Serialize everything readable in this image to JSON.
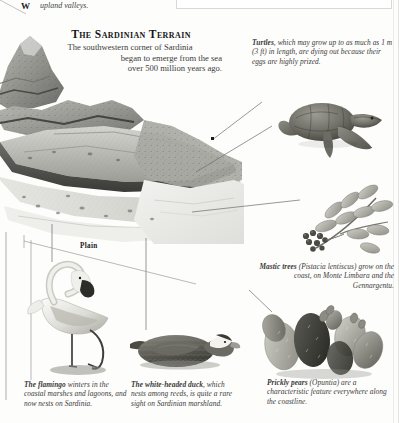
{
  "document": {
    "fragment_top": {
      "glyph": "W",
      "text": "upland valleys."
    },
    "title": "The Sardinian Terrain",
    "subtitle_lines": [
      "The southwestern corner of Sardinia",
      "began to emerge from the sea",
      "over 500 million years ago."
    ],
    "diagram_label": "Plain"
  },
  "captions": {
    "turtle": {
      "lead": "Turtles",
      "body": ", which may grow up to as much as 1 m (3 ft) in length, are dying out because their eggs are highly prized."
    },
    "mastic": {
      "lead": "Mastic trees",
      "body": " (Pistacia lentiscus) grow on the coast, on Monte Limbara and the Gennargentu."
    },
    "flamingo": {
      "lead": "The flamingo",
      "body": " winters in the coastal marshes and lagoons, and now nests on Sardinia."
    },
    "duck": {
      "lead": "The white-headed duck",
      "body": ", which nests among reeds, is quite a rare sight on Sardinian marshland."
    },
    "prickly": {
      "lead": "Prickly pears",
      "body": " (Opuntia) are a characteristic feature everywhere along the coastline."
    }
  },
  "illustrations": {
    "terrain": "geological-block-diagram",
    "turtle": "sea-turtle",
    "mastic": "mastic-branch-with-berries",
    "flamingo": "flamingo-standing",
    "duck": "white-headed-duck",
    "prickly": "prickly-pear-cactus"
  },
  "colors": {
    "ink": "#2b2b2b",
    "title_ink": "#151515",
    "paper": "#fdfdfc",
    "leader": "#5a5a5a",
    "illustration_mid": "#9a9a96",
    "illustration_dark": "#4d4d4a"
  }
}
